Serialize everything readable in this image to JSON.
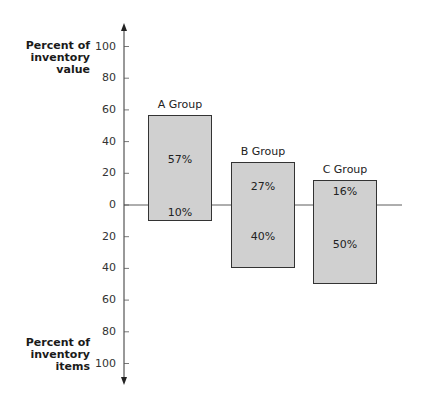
{
  "chart_data": {
    "type": "bar",
    "subtype": "diverging",
    "title": "",
    "categories": [
      "A Group",
      "B Group",
      "C Group"
    ],
    "series": [
      {
        "name": "Percent of inventory value",
        "direction": "up",
        "values": [
          57,
          27,
          16
        ],
        "labels": [
          "57%",
          "27%",
          "16%"
        ]
      },
      {
        "name": "Percent of inventory items",
        "direction": "down",
        "values": [
          10,
          40,
          50
        ],
        "labels": [
          "10%",
          "40%",
          "50%"
        ]
      }
    ],
    "y_axis_upper": {
      "label": "Percent of inventory value",
      "ticks": [
        "100",
        "80",
        "60",
        "40",
        "20",
        "0"
      ],
      "range": [
        0,
        100
      ]
    },
    "y_axis_lower": {
      "label": "Percent of inventory items",
      "ticks": [
        "20",
        "40",
        "60",
        "80",
        "100"
      ],
      "range": [
        0,
        100
      ]
    },
    "grid": false,
    "legend": "none",
    "colors": {
      "bar_fill": "#d0d0d0",
      "bar_border": "#333333",
      "axis": "#333333"
    }
  },
  "labels": {
    "upper_axis_line1": "Percent of",
    "upper_axis_line2": "inventory",
    "upper_axis_line3": "value",
    "lower_axis_line1": "Percent of",
    "lower_axis_line2": "inventory",
    "lower_axis_line3": "items"
  }
}
